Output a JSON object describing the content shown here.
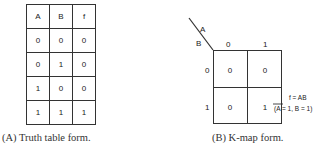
{
  "truth_table": {
    "headers": [
      "A",
      "B",
      "f"
    ],
    "rows": [
      [
        "0",
        "0",
        "0"
      ],
      [
        "0",
        "1",
        "0"
      ],
      [
        "1",
        "0",
        "0"
      ],
      [
        "1",
        "1",
        "1"
      ]
    ],
    "caption": "(A) Truth table form."
  },
  "kmap": {
    "var_top": "A",
    "var_side": "B",
    "col_labels": [
      "0",
      "1"
    ],
    "row_labels": [
      "0",
      "1"
    ],
    "cells": [
      [
        "0",
        "0"
      ],
      [
        "0",
        "1"
      ]
    ],
    "annotation_line1": "f = AB",
    "annotation_line2": "(A = 1, B = 1)",
    "caption": "(B) K-map form."
  }
}
